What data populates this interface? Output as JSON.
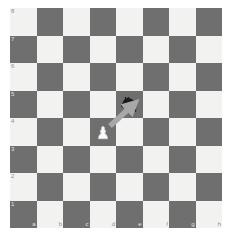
{
  "board": {
    "title": "chess-board",
    "orientation": "white",
    "files": [
      "a",
      "b",
      "c",
      "d",
      "e",
      "f",
      "g",
      "h"
    ],
    "ranks": [
      "8",
      "7",
      "6",
      "5",
      "4",
      "3",
      "2",
      "1"
    ],
    "colors": {
      "light_square": "#f2f2f0",
      "dark_square": "#6f6f6f",
      "background": "#ffffff",
      "label_on_light": "#8e8e8c",
      "label_on_dark": "#e4e4e2",
      "arrow": "#a8a8a8",
      "black_piece": "#1c1c1c",
      "white_piece": "#fafafa"
    },
    "pieces": [
      {
        "id": "black-knight-e5",
        "type": "knight",
        "color": "black",
        "square": "e5",
        "file_index": 4,
        "rank_index": 3
      },
      {
        "id": "white-pawn-d4",
        "type": "pawn",
        "color": "white",
        "square": "d4",
        "file_index": 3,
        "rank_index": 4
      }
    ],
    "arrow": {
      "id": "move-arrow-d4-e5",
      "from": "d4",
      "to": "e5",
      "color": "#a8a8a8",
      "label": "arrow from d4 to e5"
    }
  },
  "squares": [
    {
      "name": "a8",
      "shade": "light",
      "rank": "8",
      "file": ""
    },
    {
      "name": "b8",
      "shade": "dark",
      "rank": "",
      "file": ""
    },
    {
      "name": "c8",
      "shade": "light",
      "rank": "",
      "file": ""
    },
    {
      "name": "d8",
      "shade": "dark",
      "rank": "",
      "file": ""
    },
    {
      "name": "e8",
      "shade": "light",
      "rank": "",
      "file": ""
    },
    {
      "name": "f8",
      "shade": "dark",
      "rank": "",
      "file": ""
    },
    {
      "name": "g8",
      "shade": "light",
      "rank": "",
      "file": ""
    },
    {
      "name": "h8",
      "shade": "dark",
      "rank": "",
      "file": ""
    },
    {
      "name": "a7",
      "shade": "dark",
      "rank": "7",
      "file": ""
    },
    {
      "name": "b7",
      "shade": "light",
      "rank": "",
      "file": ""
    },
    {
      "name": "c7",
      "shade": "dark",
      "rank": "",
      "file": ""
    },
    {
      "name": "d7",
      "shade": "light",
      "rank": "",
      "file": ""
    },
    {
      "name": "e7",
      "shade": "dark",
      "rank": "",
      "file": ""
    },
    {
      "name": "f7",
      "shade": "light",
      "rank": "",
      "file": ""
    },
    {
      "name": "g7",
      "shade": "dark",
      "rank": "",
      "file": ""
    },
    {
      "name": "h7",
      "shade": "light",
      "rank": "",
      "file": ""
    },
    {
      "name": "a6",
      "shade": "light",
      "rank": "6",
      "file": ""
    },
    {
      "name": "b6",
      "shade": "dark",
      "rank": "",
      "file": ""
    },
    {
      "name": "c6",
      "shade": "light",
      "rank": "",
      "file": ""
    },
    {
      "name": "d6",
      "shade": "dark",
      "rank": "",
      "file": ""
    },
    {
      "name": "e6",
      "shade": "light",
      "rank": "",
      "file": ""
    },
    {
      "name": "f6",
      "shade": "dark",
      "rank": "",
      "file": ""
    },
    {
      "name": "g6",
      "shade": "light",
      "rank": "",
      "file": ""
    },
    {
      "name": "h6",
      "shade": "dark",
      "rank": "",
      "file": ""
    },
    {
      "name": "a5",
      "shade": "dark",
      "rank": "5",
      "file": ""
    },
    {
      "name": "b5",
      "shade": "light",
      "rank": "",
      "file": ""
    },
    {
      "name": "c5",
      "shade": "dark",
      "rank": "",
      "file": ""
    },
    {
      "name": "d5",
      "shade": "light",
      "rank": "",
      "file": ""
    },
    {
      "name": "e5",
      "shade": "dark",
      "rank": "",
      "file": ""
    },
    {
      "name": "f5",
      "shade": "light",
      "rank": "",
      "file": ""
    },
    {
      "name": "g5",
      "shade": "dark",
      "rank": "",
      "file": ""
    },
    {
      "name": "h5",
      "shade": "light",
      "rank": "",
      "file": ""
    },
    {
      "name": "a4",
      "shade": "light",
      "rank": "4",
      "file": ""
    },
    {
      "name": "b4",
      "shade": "dark",
      "rank": "",
      "file": ""
    },
    {
      "name": "c4",
      "shade": "light",
      "rank": "",
      "file": ""
    },
    {
      "name": "d4",
      "shade": "dark",
      "rank": "",
      "file": ""
    },
    {
      "name": "e4",
      "shade": "light",
      "rank": "",
      "file": ""
    },
    {
      "name": "f4",
      "shade": "dark",
      "rank": "",
      "file": ""
    },
    {
      "name": "g4",
      "shade": "light",
      "rank": "",
      "file": ""
    },
    {
      "name": "h4",
      "shade": "dark",
      "rank": "",
      "file": ""
    },
    {
      "name": "a3",
      "shade": "dark",
      "rank": "3",
      "file": ""
    },
    {
      "name": "b3",
      "shade": "light",
      "rank": "",
      "file": ""
    },
    {
      "name": "c3",
      "shade": "dark",
      "rank": "",
      "file": ""
    },
    {
      "name": "d3",
      "shade": "light",
      "rank": "",
      "file": ""
    },
    {
      "name": "e3",
      "shade": "dark",
      "rank": "",
      "file": ""
    },
    {
      "name": "f3",
      "shade": "light",
      "rank": "",
      "file": ""
    },
    {
      "name": "g3",
      "shade": "dark",
      "rank": "",
      "file": ""
    },
    {
      "name": "h3",
      "shade": "light",
      "rank": "",
      "file": ""
    },
    {
      "name": "a2",
      "shade": "light",
      "rank": "2",
      "file": ""
    },
    {
      "name": "b2",
      "shade": "dark",
      "rank": "",
      "file": ""
    },
    {
      "name": "c2",
      "shade": "light",
      "rank": "",
      "file": ""
    },
    {
      "name": "d2",
      "shade": "dark",
      "rank": "",
      "file": ""
    },
    {
      "name": "e2",
      "shade": "light",
      "rank": "",
      "file": ""
    },
    {
      "name": "f2",
      "shade": "dark",
      "rank": "",
      "file": ""
    },
    {
      "name": "g2",
      "shade": "light",
      "rank": "",
      "file": ""
    },
    {
      "name": "h2",
      "shade": "dark",
      "rank": "",
      "file": ""
    },
    {
      "name": "a1",
      "shade": "dark",
      "rank": "1",
      "file": "a"
    },
    {
      "name": "b1",
      "shade": "light",
      "rank": "",
      "file": "b"
    },
    {
      "name": "c1",
      "shade": "dark",
      "rank": "",
      "file": "c"
    },
    {
      "name": "d1",
      "shade": "light",
      "rank": "",
      "file": "d"
    },
    {
      "name": "e1",
      "shade": "dark",
      "rank": "",
      "file": "e"
    },
    {
      "name": "f1",
      "shade": "light",
      "rank": "",
      "file": "f"
    },
    {
      "name": "g1",
      "shade": "dark",
      "rank": "",
      "file": "g"
    },
    {
      "name": "h1",
      "shade": "light",
      "rank": "",
      "file": "h"
    }
  ]
}
